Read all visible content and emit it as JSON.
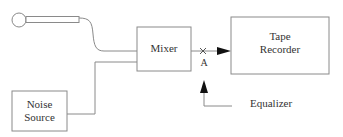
{
  "diagram": {
    "nodes": {
      "microphone": {
        "label": ""
      },
      "mixer": {
        "label": "Mixer"
      },
      "tape_recorder": {
        "line1": "Tape",
        "line2": "Recorder"
      },
      "noise_source": {
        "line1": "Noise",
        "line2": "Source"
      },
      "equalizer": {
        "label": "Equalizer"
      }
    },
    "point_label": "A",
    "edges": [
      {
        "from": "microphone",
        "to": "mixer"
      },
      {
        "from": "noise_source",
        "to": "mixer"
      },
      {
        "from": "mixer",
        "to": "tape_recorder",
        "via": "A"
      },
      {
        "from": "equalizer",
        "to": "A"
      }
    ],
    "colors": {
      "stroke": "#8a8a8a",
      "arrow": "#111111",
      "text": "#333333"
    }
  }
}
